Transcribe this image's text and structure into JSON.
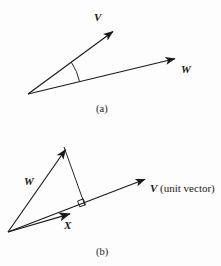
{
  "figure": {
    "background_color": "#fdfdfd",
    "ink_color": "#1a1a1a",
    "width": 221,
    "height": 266,
    "panels": [
      {
        "id": "a",
        "caption": "(a)",
        "description": "Two vectors V and W drawn from a common origin with an arc marking the angle between them",
        "labels": [
          {
            "name": "vector-v",
            "text": "V",
            "style": "bold-italic"
          },
          {
            "name": "vector-w",
            "text": "W",
            "style": "bold-italic"
          }
        ],
        "origin": {
          "x": 28,
          "y": 94
        },
        "vectors": [
          {
            "name": "V",
            "tip": {
              "x": 115,
              "y": 30
            }
          },
          {
            "name": "W",
            "tip": {
              "x": 178,
              "y": 58
            }
          }
        ],
        "angle_arc": true
      },
      {
        "id": "b",
        "caption": "(b)",
        "description": "Vector W from origin to apex, vector X along the unit vector V direction, with a perpendicular dropped from the apex of W to the line of V forming a right angle",
        "labels": [
          {
            "name": "vector-w",
            "text": "W",
            "style": "bold-italic"
          },
          {
            "name": "vector-x",
            "text": "X",
            "style": "bold-italic"
          },
          {
            "name": "vector-v-unit-italic",
            "text": "V",
            "style": "bold-italic"
          },
          {
            "name": "vector-v-unit-note",
            "text": " (unit vector)",
            "style": "regular"
          }
        ],
        "origin": {
          "x": 8,
          "y": 232
        },
        "apex": {
          "x": 64,
          "y": 147
        },
        "projection_foot": {
          "x": 85,
          "y": 205
        },
        "vectors": [
          {
            "name": "W",
            "tip": {
              "x": 64,
              "y": 147
            }
          },
          {
            "name": "X",
            "tip": {
              "x": 73,
              "y": 213
            }
          },
          {
            "name": "V",
            "tip": {
              "x": 148,
              "y": 178
            }
          }
        ],
        "right_angle_marker": true
      }
    ]
  },
  "labels": {
    "panel_a": {
      "v": "V",
      "w": "W",
      "caption": "(a)"
    },
    "panel_b": {
      "w": "W",
      "x": "X",
      "v_symbol": "V",
      "v_note": " (unit vector)",
      "caption": "(b)"
    }
  }
}
